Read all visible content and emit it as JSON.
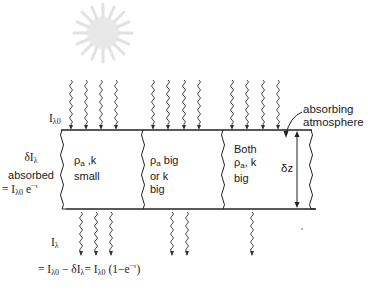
{
  "diagram": {
    "type": "radiative-absorption-schematic",
    "sun": {
      "label": "",
      "color": "#e4e4e4"
    },
    "incident_label": {
      "symbol": "I",
      "sub": "λ0"
    },
    "atmosphere_label": {
      "line1": "absorbing",
      "line2": "atmosphere"
    },
    "thickness_label": "δz",
    "columns": [
      {
        "line1_symbol": "ρ",
        "line1_sub": "a",
        "line1_rest": " ,k",
        "line2": "small",
        "line3": ""
      },
      {
        "line1_symbol": "ρ",
        "line1_sub": "a",
        "line1_rest": " big",
        "line2": "or k",
        "line3": "big"
      },
      {
        "line0": "Both",
        "line1_symbol": "ρ",
        "line1_sub": "a",
        "line1_rest": ", k",
        "line2": "big"
      }
    ],
    "absorbed": {
      "line1_symbol": "δI",
      "line1_sub": "λ",
      "line2": "absorbed",
      "line3_prefix": "= I",
      "line3_sub": "λ0",
      "line3_rest": " e",
      "line3_sup": "−τ"
    },
    "transmitted": {
      "symbol": "I",
      "sub": "λ",
      "eq_prefix": "= I",
      "eq_sub1": "λ0",
      "eq_mid": " − δI",
      "eq_sub2": "λ",
      "eq_mid2": "= I",
      "eq_sub3": "λ0",
      "eq_rest": " (1−e",
      "eq_sup": "−τ",
      "eq_end": ")"
    },
    "incoming_rays": {
      "count_per_column": [
        4,
        4,
        4
      ]
    },
    "outgoing_rays": {
      "count_per_column": [
        3,
        2,
        1
      ]
    },
    "line_color": "#222222"
  }
}
